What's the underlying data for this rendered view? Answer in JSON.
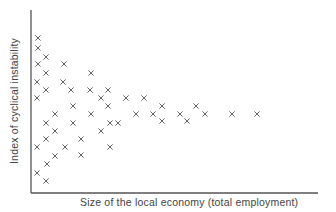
{
  "chart_data": {
    "type": "scatter",
    "title": "",
    "xlabel": "Size of the local economy (total employment)",
    "ylabel": "Index of cyclical instability",
    "marker": "x",
    "grid": false,
    "legend": null,
    "ticks": "none",
    "note": "No tick labels shown; values in plot-pixel units (x: 0 at y-axis, y: 0 at x-axis)",
    "xlim": [
      0,
      287
    ],
    "ylim": [
      0,
      183
    ],
    "points": [
      [
        7,
        155
      ],
      [
        7,
        145
      ],
      [
        15,
        136
      ],
      [
        7,
        129
      ],
      [
        33,
        129
      ],
      [
        15,
        120
      ],
      [
        60,
        120
      ],
      [
        6,
        111
      ],
      [
        32,
        111
      ],
      [
        15,
        103
      ],
      [
        40,
        103
      ],
      [
        59,
        103
      ],
      [
        77,
        103
      ],
      [
        6,
        95
      ],
      [
        70,
        95
      ],
      [
        95,
        95
      ],
      [
        113,
        95
      ],
      [
        42,
        87
      ],
      [
        77,
        87
      ],
      [
        131,
        87
      ],
      [
        165,
        87
      ],
      [
        24,
        79
      ],
      [
        60,
        79
      ],
      [
        105,
        79
      ],
      [
        122,
        79
      ],
      [
        149,
        79
      ],
      [
        174,
        79
      ],
      [
        201,
        79
      ],
      [
        226,
        79
      ],
      [
        15,
        70
      ],
      [
        42,
        70
      ],
      [
        79,
        70
      ],
      [
        87,
        70
      ],
      [
        131,
        72
      ],
      [
        156,
        72
      ],
      [
        24,
        62
      ],
      [
        70,
        62
      ],
      [
        15,
        54
      ],
      [
        50,
        54
      ],
      [
        6,
        46
      ],
      [
        34,
        46
      ],
      [
        79,
        46
      ],
      [
        24,
        37
      ],
      [
        50,
        38
      ],
      [
        16,
        29
      ],
      [
        6,
        20
      ],
      [
        15,
        12
      ]
    ]
  },
  "layout": {
    "origin_px": [
      31,
      193
    ],
    "x_axis_end_px": 318,
    "y_axis_top_px": 10,
    "marker_color": "#666666",
    "axis_color": "#555555"
  }
}
